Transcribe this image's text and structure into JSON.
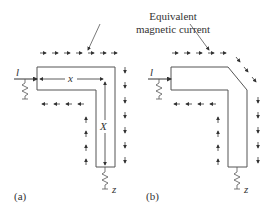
{
  "annotation": {
    "line1": "Equivalent",
    "line2": "magnetic current"
  },
  "panel_a": {
    "label": "(a)",
    "input_port": "l",
    "output_port": "z",
    "horizontal_dim": "x",
    "vertical_dim": "X"
  },
  "panel_b": {
    "label": "(b)",
    "input_port": "l",
    "output_port": "z"
  },
  "colors": {
    "stroke": "#555555",
    "arrow": "#333333"
  }
}
